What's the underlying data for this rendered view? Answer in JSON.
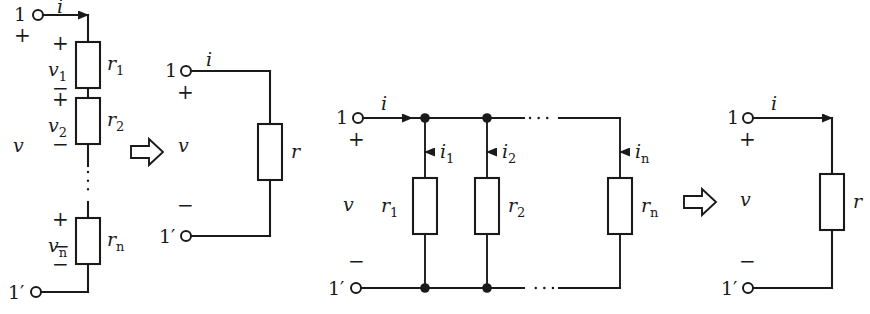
{
  "figure": {
    "background_color": "#ffffff",
    "ink_color": "#1a1a1a"
  },
  "symbols": {
    "implies_arrow": "implies-arrow",
    "terminal": "terminal-circle",
    "node": "junction-dot",
    "resistor": "resistor-box",
    "current_arrow": "current-arrow",
    "vertical_ellipsis": "vertical-dots",
    "horizontal_ellipsis": "horizontal-dots"
  },
  "circuits": [
    {
      "id": "series-network",
      "name": "Series resistor network",
      "terminals": {
        "top": "1",
        "bottom": "1′"
      },
      "port_voltage": "v",
      "port_polarity": {
        "plus": "+",
        "minus": "−"
      },
      "current": "i",
      "elements": [
        {
          "resistor": "r",
          "resistor_sub": "1",
          "voltage": "v",
          "voltage_sub": "1",
          "plus": "+",
          "minus": "−"
        },
        {
          "resistor": "r",
          "resistor_sub": "2",
          "voltage": "v",
          "voltage_sub": "2",
          "plus": "+",
          "minus": "−"
        },
        {
          "resistor": "r",
          "resistor_sub": "n",
          "voltage": "v",
          "voltage_sub": "n",
          "plus": "+",
          "minus": "−"
        }
      ],
      "ellipsis": "vertical-dots"
    },
    {
      "id": "series-equivalent",
      "name": "Series equivalent resistor",
      "terminals": {
        "top": "1",
        "bottom": "1′"
      },
      "port_voltage": "v",
      "port_polarity": {
        "plus": "+",
        "minus": "−"
      },
      "current": "i",
      "elements": [
        {
          "resistor": "r",
          "resistor_sub": ""
        }
      ]
    },
    {
      "id": "parallel-network",
      "name": "Parallel resistor network",
      "terminals": {
        "top": "1",
        "bottom": "1′"
      },
      "port_voltage": "v",
      "port_polarity": {
        "plus": "+",
        "minus": "−"
      },
      "current": "i",
      "elements": [
        {
          "resistor": "r",
          "resistor_sub": "1",
          "current": "i",
          "current_sub": "1"
        },
        {
          "resistor": "r",
          "resistor_sub": "2",
          "current": "i",
          "current_sub": "2"
        },
        {
          "resistor": "r",
          "resistor_sub": "n",
          "current": "i",
          "current_sub": "n"
        }
      ],
      "ellipsis": "horizontal-dots"
    },
    {
      "id": "parallel-equivalent",
      "name": "Parallel equivalent resistor",
      "terminals": {
        "top": "1",
        "bottom": "1′"
      },
      "port_voltage": "v",
      "port_polarity": {
        "plus": "+",
        "minus": "−"
      },
      "current": "i",
      "elements": [
        {
          "resistor": "r",
          "resistor_sub": ""
        }
      ]
    }
  ]
}
